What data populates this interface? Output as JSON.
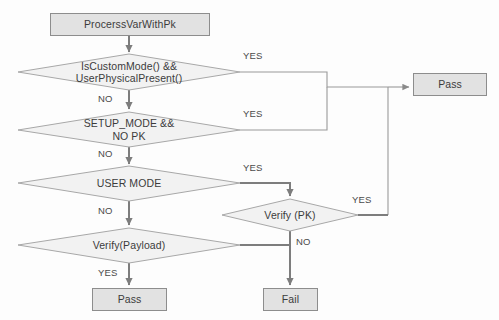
{
  "diagram": {
    "colors": {
      "node_fill": "#e2e2e2",
      "node_border": "#8d8d8d",
      "diamond_fill": "#f2f2f2",
      "diamond_border": "#a8a8a8",
      "line": "#9a9a9a",
      "line_bold": "#7d7d7d",
      "text": "#3c3c3c",
      "background": "#fdfdfd"
    },
    "nodes": {
      "start": {
        "id": "start",
        "type": "process",
        "label": "ProcerssVarWithPk"
      },
      "custom_mode": {
        "id": "custom_mode",
        "type": "decision",
        "label_line1": "IsCustomMode() &&",
        "label_line2": "UserPhysicalPresent()"
      },
      "setup_mode": {
        "id": "setup_mode",
        "type": "decision",
        "label_line1": "SETUP_MODE &&",
        "label_line2": "NO PK"
      },
      "user_mode": {
        "id": "user_mode",
        "type": "decision",
        "label_line1": "USER MODE",
        "label_line2": ""
      },
      "verify_payload": {
        "id": "verify_payload",
        "type": "decision",
        "label_line1": "Verify(Payload)",
        "label_line2": ""
      },
      "verify_pk": {
        "id": "verify_pk",
        "type": "decision",
        "label_line1": "Verify (PK)",
        "label_line2": ""
      },
      "pass_right": {
        "id": "pass_right",
        "type": "terminator",
        "label": "Pass"
      },
      "pass_bottom": {
        "id": "pass_bottom",
        "type": "terminator",
        "label": "Pass"
      },
      "fail": {
        "id": "fail",
        "type": "terminator",
        "label": "Fail"
      }
    },
    "edge_labels": {
      "custom_mode_yes": "YES",
      "custom_mode_no": "NO",
      "setup_mode_yes": "YES",
      "setup_mode_no": "NO",
      "user_mode_yes": "YES",
      "user_mode_no": "NO",
      "verify_pk_yes": "YES",
      "verify_pk_no": "NO",
      "verify_payload_yes": "YES"
    },
    "edges": [
      {
        "from": "start",
        "to": "custom_mode",
        "label": ""
      },
      {
        "from": "custom_mode",
        "to": "pass_right",
        "label": "YES"
      },
      {
        "from": "custom_mode",
        "to": "setup_mode",
        "label": "NO"
      },
      {
        "from": "setup_mode",
        "to": "pass_right",
        "label": "YES"
      },
      {
        "from": "setup_mode",
        "to": "user_mode",
        "label": "NO"
      },
      {
        "from": "user_mode",
        "to": "verify_pk",
        "label": "YES"
      },
      {
        "from": "user_mode",
        "to": "verify_payload",
        "label": "NO"
      },
      {
        "from": "verify_pk",
        "to": "pass_right",
        "label": "YES"
      },
      {
        "from": "verify_pk",
        "to": "fail",
        "label": "NO"
      },
      {
        "from": "verify_payload",
        "to": "pass_bottom",
        "label": "YES"
      },
      {
        "from": "verify_payload",
        "to": "fail",
        "label": ""
      }
    ]
  }
}
